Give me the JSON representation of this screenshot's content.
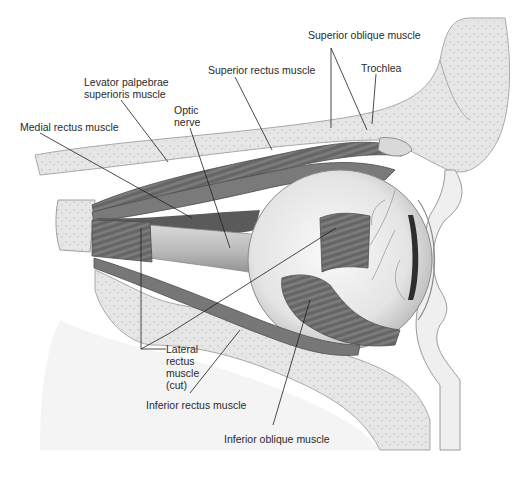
{
  "figure": {
    "labels": [
      {
        "id": "superior-oblique",
        "text": "Superior oblique muscle",
        "x": 308,
        "y": 35
      },
      {
        "id": "trochlea",
        "text": "Trochlea",
        "x": 361,
        "y": 62
      },
      {
        "id": "superior-rectus",
        "text": "Superior rectus muscle",
        "x": 208,
        "y": 64
      },
      {
        "id": "levator",
        "text": "Levator palpebrae\nsuperioris muscle",
        "x": 84,
        "y": 82
      },
      {
        "id": "optic-nerve",
        "text": "Optic\nnerve",
        "x": 174,
        "y": 104
      },
      {
        "id": "medial-rectus",
        "text": "Medial rectus muscle",
        "x": 20,
        "y": 121
      },
      {
        "id": "lateral-rectus",
        "text": "Lateral\nrectus\nmuscle\n(cut)",
        "x": 166,
        "y": 343
      },
      {
        "id": "inferior-rectus",
        "text": "Inferior rectus muscle",
        "x": 146,
        "y": 399
      },
      {
        "id": "inferior-oblique",
        "text": "Inferior oblique muscle",
        "x": 224,
        "y": 433
      }
    ]
  },
  "colors": {
    "bone": "#e8e8e8",
    "bone_edge": "#a9a9a9",
    "muscle": "#6e6e6e",
    "muscle_dark": "#4e4e4e",
    "eyeball": "#f2f2f2",
    "nerve": "#bdbdbd",
    "leader": "#1e1e1e",
    "text": "#2a2a2a"
  }
}
